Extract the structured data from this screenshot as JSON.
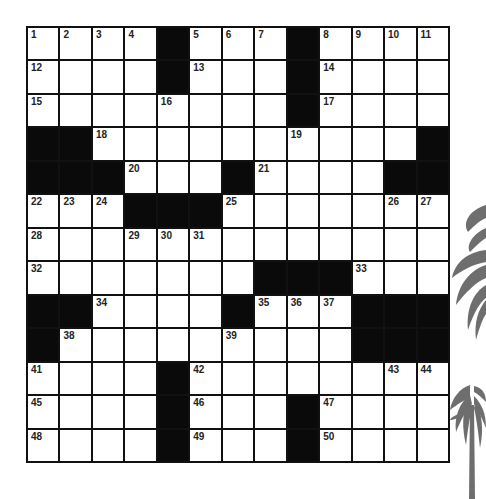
{
  "puzzle": {
    "rows": 13,
    "cols": 13,
    "grid": [
      "....#...#....",
      "....#...#....",
      "........#....",
      "##..........#",
      "###...#....##",
      "...###.......",
      ".............",
      ".......###...",
      "##....#...###",
      "#.........###",
      "....#........",
      "....#...#....",
      "....#...#...."
    ],
    "numbers": [
      {
        "r": 0,
        "c": 0,
        "n": "1"
      },
      {
        "r": 0,
        "c": 1,
        "n": "2"
      },
      {
        "r": 0,
        "c": 2,
        "n": "3"
      },
      {
        "r": 0,
        "c": 3,
        "n": "4"
      },
      {
        "r": 0,
        "c": 5,
        "n": "5"
      },
      {
        "r": 0,
        "c": 6,
        "n": "6"
      },
      {
        "r": 0,
        "c": 7,
        "n": "7"
      },
      {
        "r": 0,
        "c": 9,
        "n": "8"
      },
      {
        "r": 0,
        "c": 10,
        "n": "9"
      },
      {
        "r": 0,
        "c": 11,
        "n": "10"
      },
      {
        "r": 0,
        "c": 12,
        "n": "11"
      },
      {
        "r": 1,
        "c": 0,
        "n": "12"
      },
      {
        "r": 1,
        "c": 5,
        "n": "13"
      },
      {
        "r": 1,
        "c": 9,
        "n": "14"
      },
      {
        "r": 2,
        "c": 0,
        "n": "15"
      },
      {
        "r": 2,
        "c": 4,
        "n": "16"
      },
      {
        "r": 2,
        "c": 9,
        "n": "17"
      },
      {
        "r": 3,
        "c": 2,
        "n": "18"
      },
      {
        "r": 3,
        "c": 8,
        "n": "19"
      },
      {
        "r": 4,
        "c": 3,
        "n": "20"
      },
      {
        "r": 4,
        "c": 7,
        "n": "21"
      },
      {
        "r": 5,
        "c": 0,
        "n": "22"
      },
      {
        "r": 5,
        "c": 1,
        "n": "23"
      },
      {
        "r": 5,
        "c": 2,
        "n": "24"
      },
      {
        "r": 5,
        "c": 6,
        "n": "25"
      },
      {
        "r": 5,
        "c": 11,
        "n": "26"
      },
      {
        "r": 5,
        "c": 12,
        "n": "27"
      },
      {
        "r": 6,
        "c": 0,
        "n": "28"
      },
      {
        "r": 6,
        "c": 3,
        "n": "29"
      },
      {
        "r": 6,
        "c": 4,
        "n": "30"
      },
      {
        "r": 6,
        "c": 5,
        "n": "31"
      },
      {
        "r": 7,
        "c": 0,
        "n": "32"
      },
      {
        "r": 7,
        "c": 10,
        "n": "33"
      },
      {
        "r": 8,
        "c": 2,
        "n": "34"
      },
      {
        "r": 8,
        "c": 7,
        "n": "35"
      },
      {
        "r": 8,
        "c": 8,
        "n": "36"
      },
      {
        "r": 8,
        "c": 9,
        "n": "37"
      },
      {
        "r": 9,
        "c": 1,
        "n": "38"
      },
      {
        "r": 9,
        "c": 6,
        "n": "39"
      },
      {
        "r": 9,
        "c": 10,
        "n": "40"
      },
      {
        "r": 10,
        "c": 0,
        "n": "41"
      },
      {
        "r": 10,
        "c": 5,
        "n": "42"
      },
      {
        "r": 10,
        "c": 11,
        "n": "43"
      },
      {
        "r": 10,
        "c": 12,
        "n": "44"
      },
      {
        "r": 11,
        "c": 0,
        "n": "45"
      },
      {
        "r": 11,
        "c": 5,
        "n": "46"
      },
      {
        "r": 11,
        "c": 9,
        "n": "47"
      },
      {
        "r": 12,
        "c": 0,
        "n": "48"
      },
      {
        "r": 12,
        "c": 5,
        "n": "49"
      },
      {
        "r": 12,
        "c": 9,
        "n": "50"
      }
    ]
  },
  "decoration": {
    "palm_color": "#6e6e6e",
    "icon": "palm-tree-icon"
  }
}
